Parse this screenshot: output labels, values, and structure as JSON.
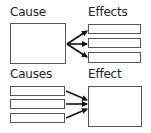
{
  "diagrams": {
    "top": {
      "left_label": "Cause",
      "right_label": "Effects",
      "left_boxes": 1,
      "right_boxes": 3,
      "relation": "one-to-many"
    },
    "bottom": {
      "left_label": "Causes",
      "right_label": "Effect",
      "left_boxes": 3,
      "right_boxes": 1,
      "relation": "many-to-one"
    }
  },
  "colors": {
    "stroke": "#555555",
    "arrow": "#111111",
    "text": "#222222",
    "background": "#ffffff"
  }
}
